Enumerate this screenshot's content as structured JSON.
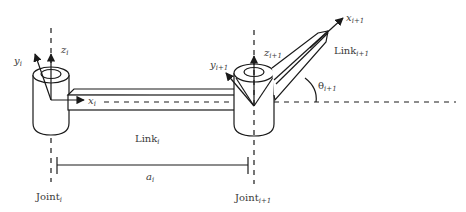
{
  "diagram": {
    "labels": {
      "y_i": {
        "base": "y",
        "sub": "i"
      },
      "z_i": {
        "base": "z",
        "sub": "i"
      },
      "x_i": {
        "base": "x",
        "sub": "i"
      },
      "y_i1": {
        "base": "y",
        "sub": "i+1"
      },
      "z_i1": {
        "base": "z",
        "sub": "i+1"
      },
      "x_i1": {
        "base": "x",
        "sub": "i+1"
      },
      "link_i": {
        "base": "Link",
        "sub": "i"
      },
      "link_i1": {
        "base": "Link",
        "sub": "i+1"
      },
      "theta_i1": {
        "base": "θ",
        "sub": "i+1"
      },
      "a_i": {
        "base": "a",
        "sub": "i"
      },
      "joint_i": {
        "base": "Joint",
        "sub": "i"
      },
      "joint_i1": {
        "base": "Joint",
        "sub": "i+1"
      }
    }
  }
}
